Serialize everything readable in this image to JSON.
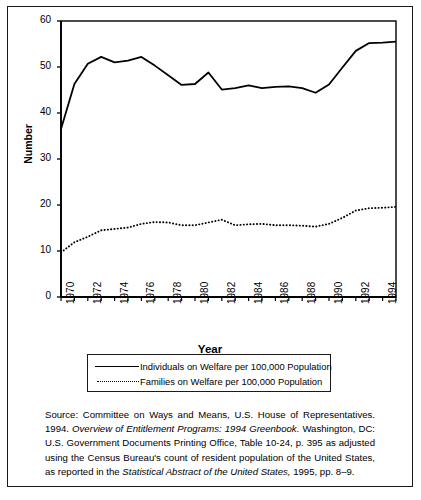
{
  "chart_data": {
    "type": "line",
    "title": "",
    "xlabel": "Year",
    "ylabel": "Number",
    "xlim": [
      1970,
      1995
    ],
    "ylim": [
      0,
      60
    ],
    "grid": false,
    "legend_position": "below-plot",
    "x": [
      1970,
      1971,
      1972,
      1973,
      1974,
      1975,
      1976,
      1977,
      1978,
      1979,
      1980,
      1981,
      1982,
      1983,
      1984,
      1985,
      1986,
      1987,
      1988,
      1989,
      1990,
      1991,
      1992,
      1993,
      1994,
      1995
    ],
    "xticks_major": [
      "1970",
      "1972",
      "1974",
      "1976",
      "1978",
      "1980",
      "1982",
      "1984",
      "1986",
      "1988",
      "1990",
      "1992",
      "1994"
    ],
    "yticks": [
      "0",
      "10",
      "20",
      "30",
      "40",
      "50",
      "60"
    ],
    "series": [
      {
        "name": "Individuals on Welfare per 100,000 Population",
        "style": "solid",
        "values": [
          36.5,
          46.3,
          50.7,
          52.2,
          51.0,
          51.4,
          52.2,
          50.3,
          48.2,
          46.1,
          46.3,
          48.8,
          45.1,
          45.4,
          46.0,
          45.4,
          45.7,
          45.8,
          45.4,
          44.4,
          46.2,
          49.9,
          53.5,
          55.2,
          55.3,
          55.5
        ]
      },
      {
        "name": "Families on Welfare per 100,000 Population",
        "style": "dotted",
        "values": [
          9.7,
          11.9,
          13.1,
          14.5,
          14.8,
          15.1,
          15.9,
          16.3,
          16.2,
          15.6,
          15.6,
          16.2,
          16.8,
          15.6,
          15.8,
          15.9,
          15.6,
          15.6,
          15.5,
          15.3,
          15.9,
          17.2,
          18.8,
          19.3,
          19.4,
          19.6
        ]
      }
    ]
  },
  "legend": {
    "items": [
      {
        "label": "Individuals on Welfare per 100,000 Population",
        "style": "solid"
      },
      {
        "label": "Families on Welfare per 100,000 Population",
        "style": "dotted"
      }
    ]
  },
  "source": {
    "line1_plain_a": "Source: Committee on Ways and Means, U.S. House of",
    "line2_plain_a": "Representatives.  1994.  ",
    "line2_italic": "Overview of Entitlement Programs:  1994",
    "line3_italic": "Greenbook.",
    "line3_plain": "  Washington, DC: U.S. Government Documents Printing",
    "line4_plain": "Office, Table 10-24, p. 395 as adjusted using the Census Bureau's",
    "line5_plain": "count of resident population of the United States, as reported in the",
    "line6_italic": "Statistical Abstract of the United States,",
    "line6_plain": " 1995, pp. 8–9."
  },
  "colors": {
    "ink": "#000000",
    "frame": "#1a1a1a",
    "background": "#ffffff"
  }
}
